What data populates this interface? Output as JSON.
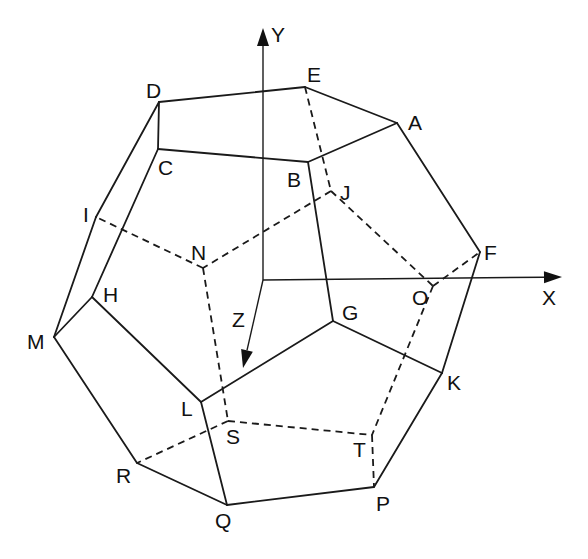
{
  "colors": {
    "line": "#1a1a1a",
    "background": "#ffffff"
  },
  "axes": {
    "origin": [
      263,
      280
    ],
    "x": {
      "label": "X",
      "end": [
        562,
        277
      ],
      "label_pos": [
        542,
        305
      ]
    },
    "y": {
      "label": "Y",
      "end": [
        263,
        28
      ],
      "label_pos": [
        271,
        42
      ]
    },
    "z": {
      "label": "Z",
      "end": [
        243,
        368
      ],
      "label_pos": [
        232,
        327
      ]
    }
  },
  "vertices": {
    "A": {
      "label": "A",
      "pos": [
        397,
        123
      ],
      "label_pos": [
        408,
        130
      ]
    },
    "B": {
      "label": "B",
      "pos": [
        308,
        162
      ],
      "label_pos": [
        287,
        187
      ]
    },
    "C": {
      "label": "C",
      "pos": [
        158,
        149
      ],
      "label_pos": [
        158,
        175
      ]
    },
    "D": {
      "label": "D",
      "pos": [
        159,
        102
      ],
      "label_pos": [
        146,
        98
      ]
    },
    "E": {
      "label": "E",
      "pos": [
        305,
        87
      ],
      "label_pos": [
        307,
        82
      ]
    },
    "F": {
      "label": "F",
      "pos": [
        480,
        252
      ],
      "label_pos": [
        484,
        260
      ]
    },
    "G": {
      "label": "G",
      "pos": [
        333,
        321
      ],
      "label_pos": [
        342,
        320
      ]
    },
    "H": {
      "label": "H",
      "pos": [
        92,
        297
      ],
      "label_pos": [
        103,
        302
      ]
    },
    "I": {
      "label": "I",
      "pos": [
        96,
        217
      ],
      "label_pos": [
        83,
        222
      ]
    },
    "J": {
      "label": "J",
      "pos": [
        331,
        191
      ],
      "label_pos": [
        340,
        200
      ]
    },
    "K": {
      "label": "K",
      "pos": [
        442,
        373
      ],
      "label_pos": [
        447,
        390
      ]
    },
    "L": {
      "label": "L",
      "pos": [
        201,
        402
      ],
      "label_pos": [
        181,
        416
      ]
    },
    "M": {
      "label": "M",
      "pos": [
        54,
        337
      ],
      "label_pos": [
        27,
        349
      ]
    },
    "N": {
      "label": "N",
      "pos": [
        203,
        268
      ],
      "label_pos": [
        191,
        260
      ]
    },
    "O": {
      "label": "O",
      "pos": [
        433,
        286
      ],
      "label_pos": [
        412,
        305
      ]
    },
    "P": {
      "label": "P",
      "pos": [
        374,
        487
      ],
      "label_pos": [
        376,
        511
      ]
    },
    "Q": {
      "label": "Q",
      "pos": [
        227,
        505
      ],
      "label_pos": [
        215,
        528
      ]
    },
    "R": {
      "label": "R",
      "pos": [
        137,
        463
      ],
      "label_pos": [
        116,
        483
      ]
    },
    "S": {
      "label": "S",
      "pos": [
        228,
        421
      ],
      "label_pos": [
        226,
        444
      ]
    },
    "T": {
      "label": "T",
      "pos": [
        372,
        435
      ],
      "label_pos": [
        353,
        457
      ]
    }
  },
  "edges_visible": [
    [
      "D",
      "E"
    ],
    [
      "E",
      "A"
    ],
    [
      "A",
      "B"
    ],
    [
      "B",
      "C"
    ],
    [
      "C",
      "D"
    ],
    [
      "D",
      "I"
    ],
    [
      "C",
      "H"
    ],
    [
      "I",
      "M"
    ],
    [
      "H",
      "M"
    ],
    [
      "A",
      "F"
    ],
    [
      "F",
      "K"
    ],
    [
      "B",
      "G"
    ],
    [
      "G",
      "K"
    ],
    [
      "G",
      "L"
    ],
    [
      "H",
      "L"
    ],
    [
      "L",
      "Q"
    ],
    [
      "M",
      "R"
    ],
    [
      "R",
      "Q"
    ],
    [
      "Q",
      "P"
    ],
    [
      "P",
      "K"
    ]
  ],
  "edges_hidden": [
    [
      "E",
      "J"
    ],
    [
      "J",
      "N"
    ],
    [
      "N",
      "I"
    ],
    [
      "N",
      "S"
    ],
    [
      "J",
      "O"
    ],
    [
      "O",
      "F"
    ],
    [
      "O",
      "T"
    ],
    [
      "S",
      "T"
    ],
    [
      "S",
      "R"
    ],
    [
      "T",
      "P"
    ]
  ]
}
